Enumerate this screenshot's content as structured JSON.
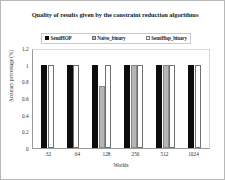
{
  "chart_data": {
    "type": "bar",
    "title": "Quality of results given by the constraint reduction algorithms",
    "xlabel": "Worlds",
    "ylabel": "Accuracy percentage (%)",
    "categories": [
      "32",
      "64",
      "128",
      "256",
      "512",
      "1024"
    ],
    "ylim": [
      0,
      1.2
    ],
    "yticks": [
      "1.2",
      "1",
      "0.8",
      "0.6",
      "0.4",
      "0.2",
      "0"
    ],
    "ytick_values": [
      1.2,
      1,
      0.8,
      0.6,
      0.4,
      0.2,
      0
    ],
    "grid": false,
    "legend_position": "top",
    "series": [
      {
        "name": "SemiHOP",
        "color": "#0d0d0d",
        "values": [
          1,
          1,
          1,
          1,
          1,
          1
        ]
      },
      {
        "name": "Naive_binary",
        "color": "#b5b5b5",
        "values": [
          0,
          0,
          0.75,
          1,
          1,
          0
        ]
      },
      {
        "name": "SemiHop_binary",
        "color": "#fdfdfd",
        "values": [
          1,
          1,
          1,
          1,
          1,
          1
        ]
      }
    ]
  }
}
